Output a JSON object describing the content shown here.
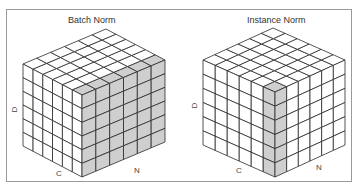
{
  "panels": [
    {
      "title": "Batch Norm",
      "axes": {
        "d": "D",
        "c": "C",
        "n": "N"
      },
      "grid_size": 6,
      "shaded": "N-face plus the N-adjacent top row (one N slice across all C,D)"
    },
    {
      "title": "Instance Norm",
      "axes": {
        "d": "D",
        "c": "C",
        "n": "N"
      },
      "grid_size": 6,
      "shaded": "single column at the front C/N edge (one N, one C, all D)"
    }
  ],
  "colors": {
    "line": "#2a2a2a",
    "fill": "#ffffff",
    "shade": "#cfcfcf",
    "frame": "#9a9a9a"
  }
}
